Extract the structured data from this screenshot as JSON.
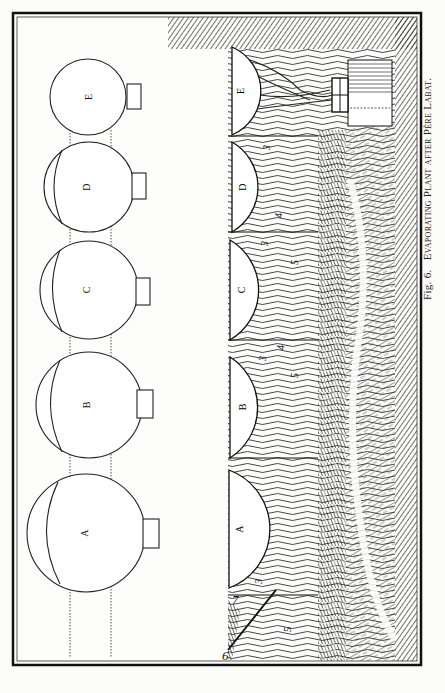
{
  "figure": {
    "caption_fig": "Fig. 6.",
    "caption_title": "Evaporating Plant after Père Labat.",
    "plan_view": {
      "vessels": [
        {
          "label": "E"
        },
        {
          "label": "D"
        },
        {
          "label": "C"
        },
        {
          "label": "B"
        },
        {
          "label": "A"
        }
      ]
    },
    "section_view": {
      "vessels": [
        {
          "label": "E"
        },
        {
          "label": "D"
        },
        {
          "label": "C"
        },
        {
          "label": "B"
        },
        {
          "label": "A"
        }
      ],
      "numbers": [
        "3",
        "3",
        "3",
        "3",
        "4",
        "4",
        "5",
        "5",
        "5",
        "7",
        "6"
      ]
    }
  }
}
